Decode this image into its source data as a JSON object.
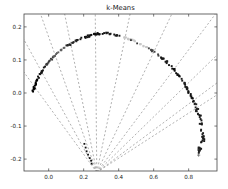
{
  "figure": {
    "title": "k-Means"
  },
  "colors": {
    "background": "#ffffff",
    "frame": "#444444",
    "tick_label": "#222222",
    "title": "#111111",
    "boundary_line": "#8f8f8f",
    "plus_marker": "#555555"
  },
  "chart_data": {
    "type": "scatter",
    "title": "k-Means",
    "xlabel": "",
    "ylabel": "",
    "grid": false,
    "legend": "none",
    "xlim": [
      -0.141,
      0.962
    ],
    "ylim": [
      -0.236,
      0.239
    ],
    "xticks": {
      "values": [
        0.0,
        0.2,
        0.4,
        0.6,
        0.8
      ],
      "labels": [
        "0.0",
        "0.2",
        "0.4",
        "0.6",
        "0.8"
      ]
    },
    "yticks": {
      "values": [
        0.2,
        0.1,
        0.0,
        -0.1,
        -0.2
      ],
      "labels": [
        "0.2",
        "0.1",
        "0.0",
        "-0.1",
        "-0.2"
      ]
    },
    "arc_ridge": [
      [
        -0.089,
        0.006
      ],
      [
        -0.061,
        0.045
      ],
      [
        -0.021,
        0.082
      ],
      [
        0.031,
        0.112
      ],
      [
        0.094,
        0.139
      ],
      [
        0.168,
        0.161
      ],
      [
        0.248,
        0.176
      ],
      [
        0.328,
        0.182
      ],
      [
        0.408,
        0.173
      ],
      [
        0.488,
        0.158
      ],
      [
        0.568,
        0.136
      ],
      [
        0.642,
        0.109
      ],
      [
        0.705,
        0.079
      ],
      [
        0.757,
        0.045
      ],
      [
        0.797,
        0.009
      ],
      [
        0.831,
        -0.03
      ],
      [
        0.86,
        -0.07
      ],
      [
        0.877,
        -0.106
      ],
      [
        0.883,
        -0.136
      ],
      [
        0.871,
        -0.164
      ],
      [
        0.854,
        -0.179
      ]
    ],
    "arc_segments": [
      {
        "color": "#000000",
        "count": 16,
        "spread": 0.9
      },
      {
        "color": "#161616",
        "count": 12,
        "spread": 0.8
      },
      {
        "color": "#3d3d3d",
        "count": 12,
        "spread": 0.8
      },
      {
        "color": "#5f5f5f",
        "count": 11,
        "spread": 0.8
      },
      {
        "color": "#262626",
        "count": 12,
        "spread": 0.8
      },
      {
        "color": "#141414",
        "count": 13,
        "spread": 0.8
      },
      {
        "color": "#0f0f0f",
        "count": 13,
        "spread": 0.9
      },
      {
        "color": "#1a1a1a",
        "count": 12,
        "spread": 0.8
      },
      {
        "color": "#c7c7c7",
        "count": 10,
        "spread": 0.7
      },
      {
        "color": "#c7c7c7",
        "count": 10,
        "spread": 0.7
      },
      {
        "color": "#454545",
        "count": 11,
        "spread": 0.8
      },
      {
        "color": "#181818",
        "count": 12,
        "spread": 0.8
      },
      {
        "color": "#0f0f0f",
        "count": 12,
        "spread": 0.8
      },
      {
        "color": "#1c1c1c",
        "count": 12,
        "spread": 0.8
      },
      {
        "color": "#101010",
        "count": 12,
        "spread": 0.9
      },
      {
        "color": "#222222",
        "count": 10,
        "spread": 1.4
      },
      {
        "color": "#1a1a1a",
        "count": 9,
        "spread": 1.7
      },
      {
        "color": "#222222",
        "count": 9,
        "spread": 1.8
      },
      {
        "color": "#1a1a1a",
        "count": 8,
        "spread": 1.8
      },
      {
        "color": "#222222",
        "count": 8,
        "spread": 1.8
      }
    ],
    "extra_clusters": [
      {
        "name": "near-boundary-chain",
        "color": "#111111",
        "points": [
          [
            0.203,
            -0.155
          ],
          [
            0.21,
            -0.166
          ],
          [
            0.218,
            -0.176
          ],
          [
            0.226,
            -0.187
          ],
          [
            0.234,
            -0.197
          ],
          [
            0.241,
            -0.206
          ],
          [
            0.247,
            -0.214
          ]
        ]
      },
      {
        "name": "light-region-specks",
        "color": "#333333",
        "points": [
          [
            0.468,
            0.161
          ],
          [
            0.503,
            0.15
          ]
        ]
      }
    ],
    "plus_marker": [
      0.857,
      -0.188
    ],
    "boundary_lines": {
      "origin": [
        0.275,
        -0.24
      ],
      "crossing_y": -0.021,
      "crossings_x": [
        -0.026,
        0.048,
        0.128,
        0.191,
        0.271,
        0.362,
        0.471,
        0.585,
        0.699,
        0.831,
        0.917
      ]
    }
  }
}
